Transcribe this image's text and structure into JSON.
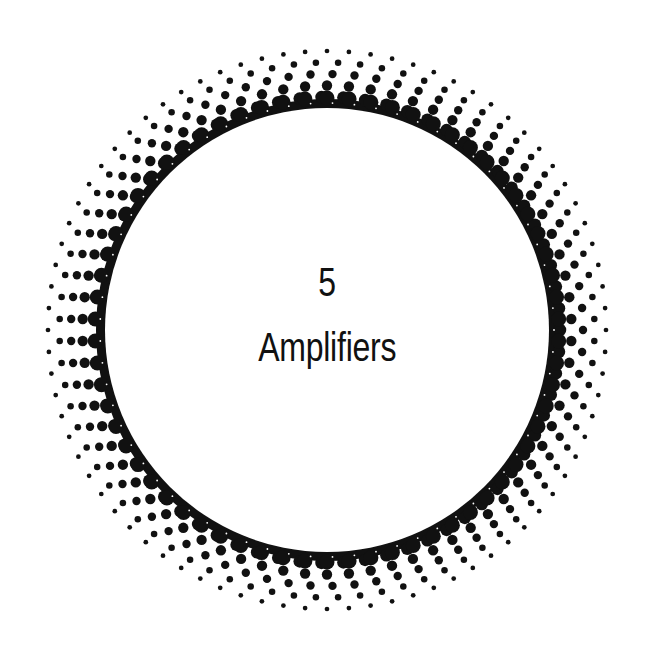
{
  "chapter": {
    "number": "5",
    "title": "Amplifiers"
  },
  "ornament": {
    "type": "halftone-ring",
    "center": [
      327,
      330
    ],
    "inner_radius": 222,
    "solid_band_outer_radius": 231,
    "outer_radius": 287,
    "ring_spacing": 11.5,
    "dot_pitch": 22,
    "max_dot_diameter": 13,
    "min_dot_diameter": 3.5,
    "ink_color": "#111111",
    "paper_color": "#ffffff"
  }
}
